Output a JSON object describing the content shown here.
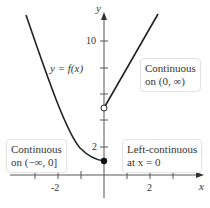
{
  "diagram": {
    "function_label": "y = f(x)",
    "axes": {
      "x_label": "x",
      "y_label": "y",
      "x_ticks": [
        "-2",
        "2"
      ],
      "y_ticks": [
        "2",
        "10"
      ]
    },
    "annotations": {
      "right_box": {
        "line1": "Continuous",
        "line2": "on (0, ∞)"
      },
      "left_box": {
        "line1": "Continuous",
        "line2": "on (−∞, 0]"
      },
      "point_box": {
        "line1": "Left-continuous",
        "line2": "at x = 0"
      }
    },
    "points": {
      "filled": {
        "x": 0,
        "y": 1
      },
      "open": {
        "x": 0,
        "y": 5
      }
    }
  }
}
